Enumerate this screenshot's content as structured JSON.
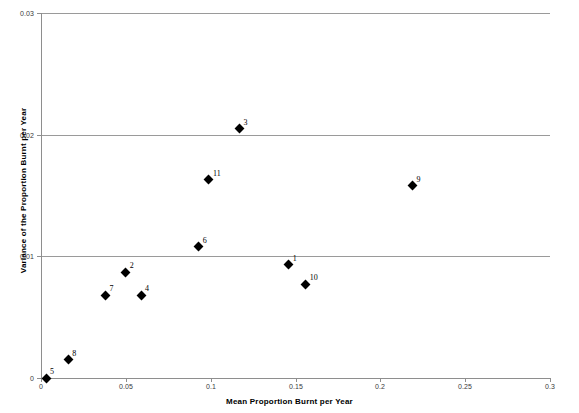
{
  "chart_data": {
    "type": "scatter",
    "title": "",
    "xlabel": "Mean Proportion Burnt per Year",
    "ylabel": "Variance of the Proportion Burnt per Year",
    "xlim": [
      0,
      0.3
    ],
    "ylim": [
      0,
      0.03
    ],
    "xticks": [
      "0",
      "0.05",
      "0.1",
      "0.15",
      "0.2",
      "0.25",
      "0.3"
    ],
    "xtickvalues": [
      0,
      0.05,
      0.1,
      0.15,
      0.2,
      0.25,
      0.3
    ],
    "yticks": [
      "0",
      "0.01",
      "0.02",
      "0.03"
    ],
    "ytickvalues": [
      0,
      0.01,
      0.02,
      0.03
    ],
    "grid": "horizontal",
    "legend": "none",
    "marker_shape": "diamond",
    "marker_color": "#000000",
    "gridline_color": "#9a9a9a",
    "axis_color": "#8e8e8e",
    "background": "#ffffff",
    "points": [
      {
        "label": "5",
        "x": 0.003,
        "y": 0.0
      },
      {
        "label": "8",
        "x": 0.016,
        "y": 0.0015
      },
      {
        "label": "7",
        "x": 0.038,
        "y": 0.0068
      },
      {
        "label": "2",
        "x": 0.05,
        "y": 0.0087
      },
      {
        "label": "4",
        "x": 0.059,
        "y": 0.0068
      },
      {
        "label": "6",
        "x": 0.093,
        "y": 0.0108
      },
      {
        "label": "11",
        "x": 0.099,
        "y": 0.0163
      },
      {
        "label": "3",
        "x": 0.117,
        "y": 0.0205
      },
      {
        "label": "1",
        "x": 0.146,
        "y": 0.0093
      },
      {
        "label": "10",
        "x": 0.156,
        "y": 0.0077
      },
      {
        "label": "9",
        "x": 0.219,
        "y": 0.0158
      }
    ]
  }
}
